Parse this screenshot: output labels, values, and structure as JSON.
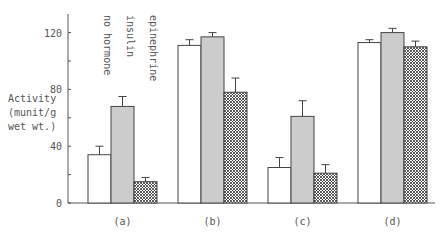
{
  "chart_data": {
    "type": "bar",
    "title": "",
    "ylabel": "Activity (munit/g wet wt.)",
    "xlabel": "",
    "ylim": [
      0,
      130
    ],
    "yticks": [
      0,
      40,
      80,
      120
    ],
    "categories": [
      "(a)",
      "(b)",
      "(c)",
      "(d)"
    ],
    "series": [
      {
        "name": "no hormone",
        "pattern": "white",
        "values": [
          34,
          111,
          25,
          113
        ],
        "errors": [
          6,
          4,
          7,
          2
        ]
      },
      {
        "name": "insulin",
        "pattern": "gray",
        "values": [
          68,
          117,
          61,
          120
        ],
        "errors": [
          7,
          3,
          11,
          3
        ]
      },
      {
        "name": "epinephrine",
        "pattern": "crosshatch",
        "values": [
          15,
          78,
          21,
          110
        ],
        "errors": [
          3,
          10,
          6,
          4
        ]
      }
    ],
    "legend_position": "top-left, rotated labels"
  },
  "ylabel_lines": [
    "Activity",
    "(munit/g",
    "wet wt.)"
  ]
}
